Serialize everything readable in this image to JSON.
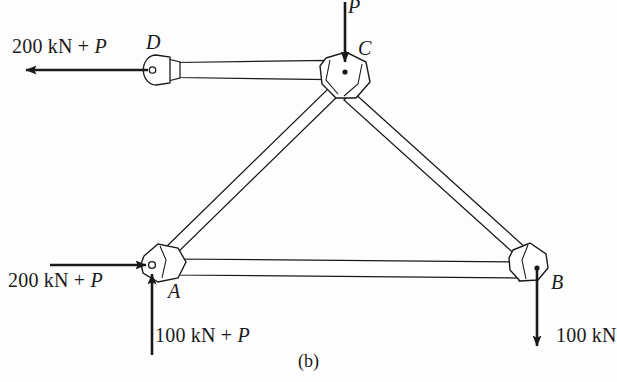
{
  "figure": {
    "caption": "(b)",
    "background_color": "#fdfdfd",
    "line_color": "#1a1a1a",
    "member_fill": "#ffffff"
  },
  "joints": [
    {
      "id": "A",
      "label": "A",
      "x": 152,
      "y": 265,
      "pin_hole": true
    },
    {
      "id": "B",
      "label": "B",
      "x": 537,
      "y": 268,
      "pin_hole": false
    },
    {
      "id": "C",
      "label": "C",
      "x": 345,
      "y": 72,
      "pin_hole": true
    },
    {
      "id": "D",
      "label": "D",
      "x": 156,
      "y": 70,
      "pin_hole": true
    }
  ],
  "members": [
    {
      "name": "member-DC",
      "from": "D",
      "to": "C"
    },
    {
      "name": "member-AC",
      "from": "A",
      "to": "C"
    },
    {
      "name": "member-CB",
      "from": "C",
      "to": "B"
    },
    {
      "name": "member-AB",
      "from": "A",
      "to": "B"
    }
  ],
  "forces": [
    {
      "name": "force-at-D",
      "magnitude": "200 kN",
      "operator": "+",
      "variable": "P",
      "label_plain": "200 kN + P",
      "direction": "left",
      "applied_at": "D"
    },
    {
      "name": "force-at-C",
      "magnitude": "",
      "operator": "",
      "variable": "P",
      "label_plain": "P",
      "direction": "down",
      "applied_at": "C"
    },
    {
      "name": "force-at-A-horizontal",
      "magnitude": "200 kN",
      "operator": "+",
      "variable": "P",
      "label_plain": "200 kN + P",
      "direction": "right",
      "applied_at": "A"
    },
    {
      "name": "force-at-A-vertical",
      "magnitude": "100 kN",
      "operator": "+",
      "variable": "P",
      "label_plain": "100 kN + P",
      "direction": "up",
      "applied_at": "A"
    },
    {
      "name": "force-at-B",
      "magnitude": "100 kN",
      "operator": "",
      "variable": "",
      "label_plain": "100 kN",
      "direction": "down",
      "applied_at": "B"
    }
  ],
  "labels": {
    "load_d_num": "200 kN",
    "load_d_op": "+",
    "load_d_var": "P",
    "joint_d": "D",
    "load_c_var": "P",
    "joint_c": "C",
    "load_a_h_num": "200 kN",
    "load_a_h_op": "+",
    "load_a_h_var": "P",
    "joint_a": "A",
    "load_a_v_num": "100 kN",
    "load_a_v_op": "+",
    "load_a_v_var": "P",
    "joint_b": "B",
    "load_b_num": "100 kN",
    "caption": "(b)"
  }
}
